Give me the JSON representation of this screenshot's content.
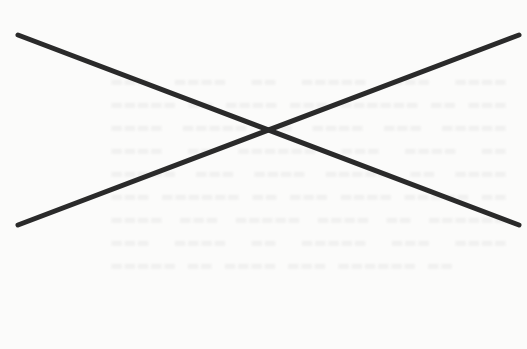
{
  "page": {
    "background": "#fbfbfa",
    "bleed_through_text": "faint illegible show-through text from reverse side of scanned page"
  },
  "cross_mark": {
    "stroke_color": "#2a2a2a",
    "stroke_width": 5,
    "lines": [
      {
        "x1": 18,
        "y1": 35,
        "x2": 519,
        "y2": 225
      },
      {
        "x1": 18,
        "y1": 225,
        "x2": 519,
        "y2": 35
      }
    ],
    "intersection": {
      "x": 263,
      "y": 130
    }
  }
}
